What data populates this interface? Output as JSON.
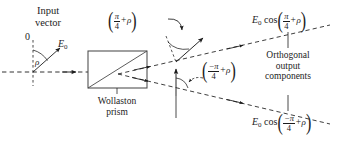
{
  "figure": {
    "background_color": "#ffffff",
    "line_color": "#1c1c1c",
    "width": 337,
    "height": 143
  },
  "labels": {
    "input_vector_line1": "Input",
    "input_vector_line2": "vector",
    "zero_marker": "0",
    "rho_angle": "ρ",
    "amplitude": "E",
    "amplitude_sub": "0",
    "prism_line1": "Wollaston",
    "prism_line2": "prism",
    "output_line1": "Orthogonal",
    "output_line2": "output",
    "output_line3": "components"
  },
  "expressions": {
    "angle_upper": {
      "open": "(",
      "numerator": "π",
      "denominator": "4",
      "operator": "+",
      "variable": "ρ",
      "close": ")",
      "plain": "(π/4 + ρ)"
    },
    "angle_lower": {
      "open": "(",
      "numerator": "−π",
      "denominator": "4",
      "operator": "+",
      "variable": "ρ",
      "close": ")",
      "plain": "(−π/4 + ρ)"
    },
    "output_upper": {
      "amplitude": "E",
      "amplitude_sub": "0",
      "function": "cos",
      "open": "(",
      "numerator": "π",
      "denominator": "4",
      "operator": "+",
      "variable": "ρ",
      "close": ")",
      "plain": "E0 cos(π/4 + ρ)"
    },
    "output_lower": {
      "amplitude": "E",
      "amplitude_sub": "0",
      "function": "cos",
      "open": "(",
      "numerator": "−π",
      "denominator": "4",
      "operator": "+",
      "variable": "ρ",
      "close": ")",
      "plain": "E0 cos(−π/4 + ρ)"
    }
  }
}
